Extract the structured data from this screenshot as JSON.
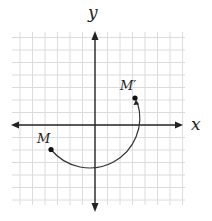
{
  "diagram": {
    "type": "coordinate-plane-rotation",
    "axes": {
      "x_label": "x",
      "y_label": "y",
      "arrows": "both-ends"
    },
    "grid": {
      "visible": true,
      "units_range_x": [
        -6,
        7
      ],
      "units_range_y": [
        -6,
        7
      ],
      "color": "#d9d9d9"
    },
    "points": [
      {
        "label": "M",
        "approx_coords": [
          -3.5,
          -2
        ]
      },
      {
        "label": "M′",
        "approx_coords": [
          3.2,
          2.2
        ]
      }
    ],
    "arc": {
      "center": [
        0,
        0
      ],
      "radius_units": 4,
      "from": "M",
      "to": "M′",
      "direction": "counterclockwise",
      "arrowhead_at": "M′"
    },
    "colors": {
      "axis": "#222222",
      "arc": "#333333",
      "grid": "#d9d9d9"
    }
  }
}
